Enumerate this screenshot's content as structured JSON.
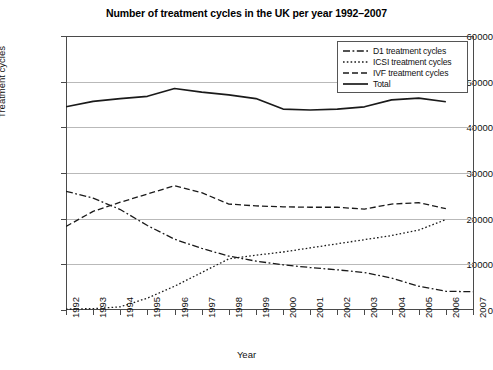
{
  "chart_data": {
    "type": "line",
    "title": "Number of treatment cycles in the UK per year 1992–2007",
    "xlabel": "Year",
    "ylabel": "Treatment cycles",
    "x": [
      1992,
      1993,
      1994,
      1995,
      1996,
      1997,
      1998,
      1999,
      2000,
      2001,
      2002,
      2003,
      2004,
      2005,
      2006,
      2007
    ],
    "categories": [
      "1992",
      "1993",
      "1994",
      "1995",
      "1996",
      "1997",
      "1998",
      "1999",
      "2000",
      "2001",
      "2002",
      "2003",
      "2004",
      "2005",
      "2006",
      "2007"
    ],
    "ylim": [
      0,
      60000
    ],
    "yticks": [
      0,
      10000,
      20000,
      30000,
      40000,
      50000,
      60000
    ],
    "ytick_labels": [
      "0",
      "10000",
      "20000",
      "30000",
      "40000",
      "50000",
      "60000"
    ],
    "grid": true,
    "legend_position": "top-right",
    "series": [
      {
        "name": "D1 treatment cycles",
        "style": "dash-dot",
        "values": [
          26000,
          24500,
          22000,
          18500,
          15500,
          13500,
          11800,
          10700,
          9900,
          9300,
          8800,
          8200,
          7000,
          5200,
          4100,
          4000
        ]
      },
      {
        "name": "ICSI treatment cycles",
        "style": "dotted",
        "values": [
          200,
          300,
          700,
          2600,
          5200,
          8200,
          11200,
          12000,
          12700,
          13600,
          14500,
          15400,
          16300,
          17500,
          19800,
          null
        ]
      },
      {
        "name": "IVF treatment cycles",
        "style": "dashed",
        "values": [
          18300,
          21600,
          23600,
          25400,
          27200,
          25700,
          23200,
          22800,
          22600,
          22500,
          22500,
          22100,
          23200,
          23500,
          22200,
          null
        ]
      },
      {
        "name": "Total",
        "style": "solid",
        "values": [
          44500,
          45700,
          46300,
          46800,
          48500,
          47700,
          47100,
          46300,
          44000,
          43800,
          44000,
          44500,
          46000,
          46400,
          45600,
          null
        ]
      }
    ]
  },
  "legend": {
    "items": [
      {
        "label": "D1 treatment cycles"
      },
      {
        "label": "ICSI treatment cycles"
      },
      {
        "label": "IVF treatment cycles"
      },
      {
        "label": "Total"
      }
    ]
  },
  "colors": {
    "line": "#1a1a1a",
    "grid": "#b9b9b9",
    "axis": "#4a4a4a",
    "background": "#ffffff"
  }
}
